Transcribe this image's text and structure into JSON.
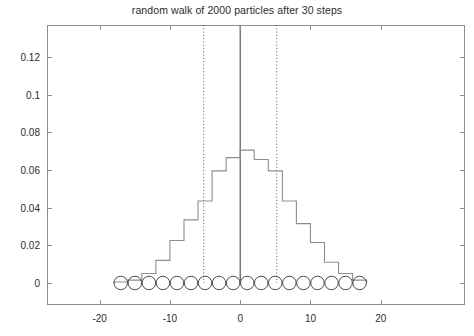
{
  "chart_data": {
    "type": "bar",
    "title": "random walk of 2000 particles after 30 steps",
    "xlabel": "",
    "ylabel": "",
    "xlim": [
      -27.5,
      32.0
    ],
    "ylim": [
      -0.0117,
      0.1369
    ],
    "xticks": [
      -20,
      -10,
      0,
      10,
      20
    ],
    "xtick_labels": [
      "-20",
      "-10",
      "0",
      "10",
      "20"
    ],
    "yticks": [
      0,
      0.02,
      0.04,
      0.06,
      0.08,
      0.1,
      0.12
    ],
    "ytick_labels": [
      "0",
      "0.02",
      "0.04",
      "0.06",
      "0.08",
      "0.1",
      "0.12"
    ],
    "grid": false,
    "legend": null,
    "plot_style": "stairs-step histogram (outline only, no fill)",
    "bin_width": 2,
    "bin_centers": [
      -17,
      -15,
      -13,
      -11,
      -9,
      -7,
      -5,
      -3,
      -1,
      1,
      3,
      5,
      7,
      9,
      11,
      13,
      15,
      17
    ],
    "bin_edges": [
      -18,
      -16,
      -14,
      -12,
      -10,
      -8,
      -6,
      -4,
      -2,
      0,
      2,
      4,
      6,
      8,
      10,
      12,
      14,
      16,
      18
    ],
    "values": [
      0.0005,
      0.0015,
      0.005,
      0.012,
      0.0225,
      0.0335,
      0.0435,
      0.0595,
      0.0665,
      0.0705,
      0.0655,
      0.0595,
      0.0435,
      0.0315,
      0.0215,
      0.011,
      0.005,
      0.0015
    ],
    "series": [
      {
        "name": "particle distribution",
        "color": "#8d8d8d",
        "values": [
          0.0005,
          0.0015,
          0.005,
          0.012,
          0.0225,
          0.0335,
          0.0435,
          0.0595,
          0.0665,
          0.0705,
          0.0655,
          0.0595,
          0.0435,
          0.0315,
          0.0215,
          0.011,
          0.005,
          0.0015
        ]
      }
    ],
    "annotations": [
      {
        "name": "mean-line",
        "type": "vline",
        "x": 0,
        "style": "solid",
        "color": "#4a4a4a",
        "y_top": 0.1369
      },
      {
        "name": "sigma-left-line",
        "type": "vline",
        "x": -5.2,
        "style": "dotted",
        "color": "#5a5a5a",
        "y_top": 0.1369
      },
      {
        "name": "sigma-right-line",
        "type": "vline",
        "x": 5.2,
        "style": "dotted",
        "color": "#5a5a5a",
        "y_top": 0.1369
      }
    ],
    "markers": {
      "name": "particle-circles",
      "shape": "circle",
      "color": "#4a4a4a",
      "y": 0,
      "count": 18,
      "x": [
        -17,
        -15,
        -13,
        -11,
        -9,
        -7,
        -5,
        -3,
        -1,
        1,
        3,
        5,
        7,
        9,
        11,
        13,
        15,
        17
      ]
    }
  },
  "figure": {
    "particles": "2000",
    "steps": "30"
  }
}
